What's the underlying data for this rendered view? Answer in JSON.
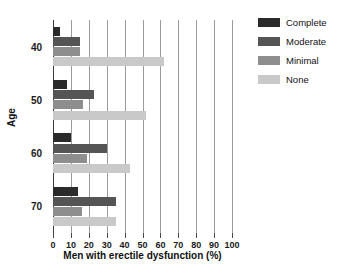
{
  "chart_data": {
    "type": "bar",
    "orientation": "horizontal",
    "title": "",
    "xlabel": "Men with erectile dysfunction (%)",
    "ylabel": "Age",
    "xlim": [
      0,
      100
    ],
    "xticks": [
      0,
      10,
      20,
      30,
      40,
      50,
      60,
      70,
      80,
      90,
      100
    ],
    "xtick_labels": [
      "0",
      "10",
      "20",
      "30",
      "40",
      "50",
      "60",
      "70",
      "80",
      "90",
      "100"
    ],
    "categories": [
      "40",
      "50",
      "60",
      "70"
    ],
    "ytick_labels": [
      "40",
      "50",
      "60",
      "70"
    ],
    "grid": "vertical",
    "legend_position": "right",
    "series": [
      {
        "name": "Complete",
        "color": "#2b2b2b",
        "values": [
          4,
          8,
          10,
          14
        ]
      },
      {
        "name": "Moderate",
        "color": "#555555",
        "values": [
          15,
          23,
          30,
          35
        ]
      },
      {
        "name": "Minimal",
        "color": "#8e8e8e",
        "values": [
          15,
          17,
          19,
          16
        ]
      },
      {
        "name": "None",
        "color": "#c9c9c9",
        "values": [
          62,
          52,
          43,
          35
        ]
      }
    ]
  },
  "legend": {
    "items": [
      {
        "label": "Complete"
      },
      {
        "label": "Moderate"
      },
      {
        "label": "Minimal"
      },
      {
        "label": "None"
      }
    ]
  },
  "axes": {
    "x_title": "Men with erectile dysfunction (%)",
    "y_title": "Age"
  },
  "colors": {
    "background": "#ffffff",
    "axis": "#3a3a3a",
    "grid": "#9a9a9a",
    "text": "#111111"
  }
}
